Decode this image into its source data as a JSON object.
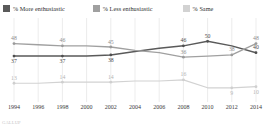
{
  "legend": {
    "entries": [
      {
        "label": "% More enthusiastic",
        "color": "#5a5a5a",
        "key": "more"
      },
      {
        "label": "% Less enthusiastic",
        "color": "#a0a0a0",
        "key": "less"
      },
      {
        "label": "% Same",
        "color": "#d2d2d2",
        "key": "same"
      }
    ]
  },
  "footer": {
    "text": "GALLUP"
  },
  "chart_data": {
    "type": "line",
    "title": "",
    "subtitle": "",
    "xlabel": "",
    "ylabel": "",
    "grid": true,
    "legend_position": "top",
    "ylim": [
      0,
      60
    ],
    "categories": [
      "1994",
      "1996",
      "1998",
      "2000",
      "2002",
      "2004",
      "2006",
      "2008",
      "2010",
      "2012",
      "2014"
    ],
    "x_tick_labels": [
      "1994",
      "1996",
      "1998",
      "2000",
      "2002",
      "2004",
      "2006",
      "2008",
      "2010",
      "2012",
      "2014"
    ],
    "series": [
      {
        "name": "% More enthusiastic",
        "color": "#5a5a5a",
        "values": [
          37,
          37,
          37,
          37,
          38,
          41,
          44,
          46,
          50,
          46,
          40
        ],
        "labeled_points": [
          {
            "index": 0,
            "value": 37
          },
          {
            "index": 2,
            "value": 37
          },
          {
            "index": 4,
            "value": 38
          },
          {
            "index": 7,
            "value": 46
          },
          {
            "index": 8,
            "value": 50
          },
          {
            "index": 10,
            "value": 40
          }
        ]
      },
      {
        "name": "% Less enthusiastic",
        "color": "#a0a0a0",
        "values": [
          48,
          47,
          46,
          46,
          45,
          42,
          40,
          36,
          37,
          38,
          48
        ],
        "labeled_points": [
          {
            "index": 0,
            "value": 48
          },
          {
            "index": 2,
            "value": 46
          },
          {
            "index": 4,
            "value": 45
          },
          {
            "index": 7,
            "value": 36
          },
          {
            "index": 9,
            "value": 38
          },
          {
            "index": 10,
            "value": 48
          }
        ]
      },
      {
        "name": "% Same",
        "color": "#d2d2d2",
        "values": [
          13,
          13,
          14,
          14,
          14,
          15,
          15,
          16,
          9,
          9,
          10
        ],
        "labeled_points": [
          {
            "index": 0,
            "value": 13
          },
          {
            "index": 2,
            "value": 14
          },
          {
            "index": 4,
            "value": 14
          },
          {
            "index": 7,
            "value": 16
          },
          {
            "index": 9,
            "value": 9
          },
          {
            "index": 10,
            "value": 10
          }
        ]
      }
    ]
  }
}
